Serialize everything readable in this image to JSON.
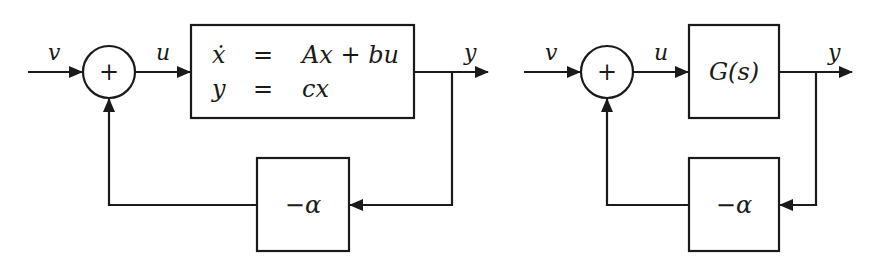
{
  "colors": {
    "stroke": "#1a1a1a",
    "background": "#ffffff"
  },
  "left_diagram": {
    "input_label": "v",
    "summer_symbol": "+",
    "control_label": "u",
    "plant": {
      "row1": {
        "lhs": "ẋ",
        "eq": "=",
        "rhs": "Ax + bu"
      },
      "row2": {
        "lhs": "y",
        "eq": "=",
        "rhs": "cx"
      }
    },
    "output_label": "y",
    "feedback_gain": "−α"
  },
  "right_diagram": {
    "input_label": "v",
    "summer_symbol": "+",
    "control_label": "u",
    "plant": {
      "label": "G(s)"
    },
    "output_label": "y",
    "feedback_gain": "−α"
  }
}
